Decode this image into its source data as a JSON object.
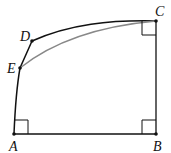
{
  "diagram": {
    "points": {
      "A": {
        "label": "A",
        "x": 14,
        "y": 134
      },
      "B": {
        "label": "B",
        "x": 156,
        "y": 134
      },
      "C": {
        "label": "C",
        "x": 156,
        "y": 21
      },
      "D": {
        "label": "D",
        "x": 32,
        "y": 41
      },
      "E": {
        "label": "E",
        "x": 20,
        "y": 68
      }
    },
    "right_angles": [
      "A",
      "B",
      "C"
    ],
    "colors": {
      "stroke": "#111111",
      "secondary_curve": "#888888"
    }
  }
}
